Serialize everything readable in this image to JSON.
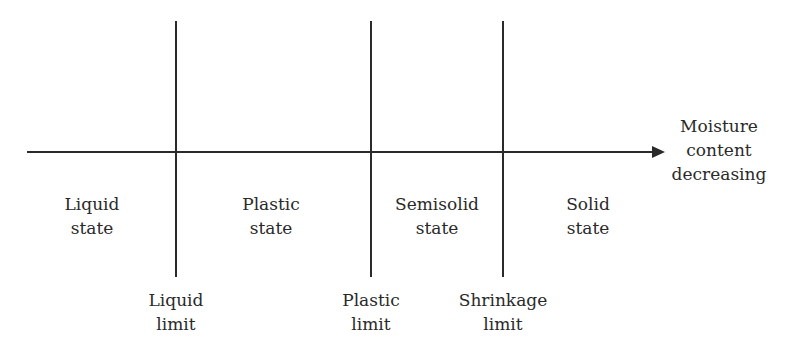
{
  "axis": {
    "label_lines": [
      "Moisture",
      "content",
      "decreasing"
    ],
    "direction": "right"
  },
  "states": [
    {
      "id": "liquid",
      "lines": [
        "Liquid",
        "state"
      ]
    },
    {
      "id": "plastic",
      "lines": [
        "Plastic",
        "state"
      ]
    },
    {
      "id": "semisolid",
      "lines": [
        "Semisolid",
        "state"
      ]
    },
    {
      "id": "solid",
      "lines": [
        "Solid",
        "state"
      ]
    }
  ],
  "limits": [
    {
      "id": "liquid-limit",
      "lines": [
        "Liquid",
        "limit"
      ]
    },
    {
      "id": "plastic-limit",
      "lines": [
        "Plastic",
        "limit"
      ]
    },
    {
      "id": "shrinkage-limit",
      "lines": [
        "Shrinkage",
        "limit"
      ]
    }
  ],
  "colors": {
    "line": "#2a2a2a",
    "background": "#ffffff"
  }
}
